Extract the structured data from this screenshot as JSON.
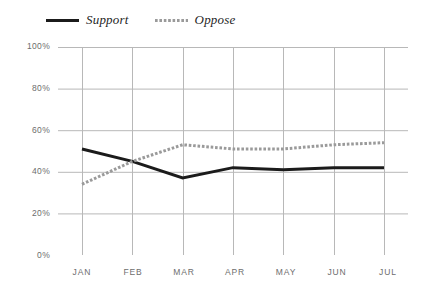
{
  "chart_data": {
    "type": "line",
    "title": "",
    "subtitle": "",
    "xlabel": "",
    "ylabel": "",
    "categories": [
      "JAN",
      "FEB",
      "MAR",
      "APR",
      "MAY",
      "JUN",
      "JUL"
    ],
    "series": [
      {
        "name": "Support",
        "values": [
          51,
          45,
          37,
          42,
          41,
          42,
          42
        ],
        "color": "#1b1b1b",
        "style": "solid",
        "width": 3
      },
      {
        "name": "Oppose",
        "values": [
          34,
          45,
          53,
          51,
          51,
          53,
          54
        ],
        "color": "#9a9a9a",
        "style": "dotted",
        "width": 3
      }
    ],
    "ylim": [
      0,
      100
    ],
    "ytick_labels": [
      "100%",
      "80%",
      "60%",
      "40%",
      "20%",
      "0%"
    ],
    "ytick_values": [
      100,
      80,
      60,
      40,
      20,
      0
    ],
    "xtick_labels": [
      "JAN",
      "FEB",
      "MAR",
      "APR",
      "MAY",
      "JUN",
      "JUL"
    ],
    "grid": true,
    "grid_color": "#b8b8b8",
    "legend_position": "top-left",
    "legend": [
      {
        "label": "Support",
        "swatch": "solid-line-swatch"
      },
      {
        "label": "Oppose",
        "swatch": "dotted-line-swatch"
      }
    ]
  }
}
